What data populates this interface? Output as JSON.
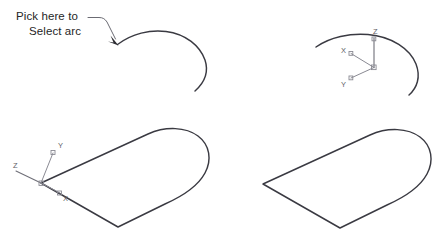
{
  "diagram": {
    "background_color": "#ffffff",
    "line_color": "#3a3a42",
    "ucs_color": "#8a8a93",
    "text_color": "#262626"
  },
  "callout": {
    "line1": "Pick here to",
    "line2": "Select arc",
    "leader_icon": "arrow-icon"
  },
  "panels": [
    {
      "id": "top-left",
      "name": "open-arc-with-callout",
      "description": "Open arc with pick-point callout arrow"
    },
    {
      "id": "top-right",
      "name": "open-arc-with-ucs",
      "description": "Open arc with UCS axis icon"
    },
    {
      "id": "bottom-left",
      "name": "closed-profile-with-ucs",
      "description": "Closed D-shaped profile with UCS axis icon at origin"
    },
    {
      "id": "bottom-right",
      "name": "closed-profile",
      "description": "Closed D-shaped profile"
    }
  ],
  "ucs_top_right": {
    "x_label": "X",
    "y_label": "Y",
    "z_label": "Z"
  },
  "ucs_bottom_left": {
    "x_label": "X",
    "y_label": "Y",
    "z_label": "Z"
  }
}
